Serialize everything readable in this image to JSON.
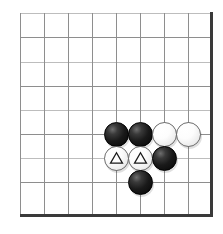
{
  "diagram": {
    "kind": "go-board-corner-diagram",
    "width": 223,
    "height": 234,
    "background_color": "#ffffff"
  },
  "board": {
    "grid_line_color": "#8e8e8e",
    "grid_line_faint_color": "#bdbdbd",
    "edge_line_color": "#3a3a3a",
    "origin_x": 20,
    "origin_y": 13,
    "spacing": 24,
    "columns_x": [
      20,
      44,
      68,
      92,
      116,
      140,
      164,
      188,
      211
    ],
    "rows_y": [
      13,
      37,
      62,
      86,
      110,
      134,
      158,
      182,
      215
    ],
    "faint_row_indices": [
      0,
      2,
      4,
      6
    ],
    "edges": {
      "right_x": 210,
      "right_top": 12,
      "right_height": 205,
      "bottom_y": 214,
      "bottom_left": 20,
      "bottom_width": 193
    }
  },
  "stones": [
    {
      "id": "stone-1",
      "color": "black",
      "cx": 116,
      "cy": 134,
      "mark": "none",
      "col": 4,
      "row": 5
    },
    {
      "id": "stone-2",
      "color": "black",
      "cx": 140,
      "cy": 134,
      "mark": "none",
      "col": 5,
      "row": 5
    },
    {
      "id": "stone-3",
      "color": "white",
      "cx": 164,
      "cy": 134,
      "mark": "none",
      "col": 6,
      "row": 5
    },
    {
      "id": "stone-4",
      "color": "white",
      "cx": 188,
      "cy": 134,
      "mark": "none",
      "col": 7,
      "row": 5
    },
    {
      "id": "stone-5",
      "color": "white",
      "cx": 116,
      "cy": 158,
      "mark": "triangle",
      "col": 4,
      "row": 6
    },
    {
      "id": "stone-6",
      "color": "white",
      "cx": 140,
      "cy": 158,
      "mark": "triangle",
      "col": 5,
      "row": 6
    },
    {
      "id": "stone-7",
      "color": "black",
      "cx": 164,
      "cy": 158,
      "mark": "none",
      "col": 6,
      "row": 6
    },
    {
      "id": "stone-8",
      "color": "black",
      "cx": 140,
      "cy": 182,
      "mark": "none",
      "col": 5,
      "row": 7
    }
  ],
  "marks": {
    "triangle_stroke_color": "#1a1a1a",
    "triangle_fill": "none",
    "triangle_count": 2
  }
}
